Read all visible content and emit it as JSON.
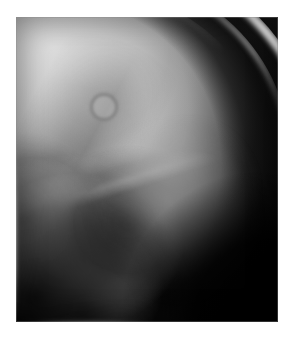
{
  "page": {
    "background_color": "#ffffff",
    "width": 294,
    "height": 337
  },
  "figure": {
    "type": "radiograph",
    "modality": "X-ray",
    "view": "lateral",
    "body_part": "skull",
    "plate": {
      "left": 16,
      "top": 17,
      "width": 262,
      "height": 305,
      "background_color": "#050505",
      "film_base_color": "#6a6a6a",
      "brightest_color": "#fdfdfd",
      "darkest_color": "#050505"
    },
    "regions": [
      {
        "name": "cranial-vault",
        "label": "Cranial vault soft-tissue shadow",
        "tone": "mid-grey",
        "color": "#c4c4c4"
      },
      {
        "name": "outer-table-arc",
        "label": "Bright outer table of skull",
        "tone": "bright",
        "color": "#f5f5f5"
      },
      {
        "name": "inner-table-arc",
        "label": "Inner table / diploe",
        "tone": "light-grey",
        "color": "#cdcdcd"
      },
      {
        "name": "diploe-dark-crescent",
        "label": "Dark crescent of diploic space",
        "tone": "dark",
        "color": "#121212"
      },
      {
        "name": "petrous-mastoid-mass",
        "label": "Dense petrous and mastoid bone",
        "tone": "very-bright",
        "color": "#fdfdfd"
      },
      {
        "name": "mastoid-air-cells",
        "label": "Mottled mastoid air cells",
        "tone": "mottled-dark",
        "color": "#1e1e1e"
      },
      {
        "name": "skull-base-lines",
        "label": "Skull base lamina lines",
        "tone": "bright-line",
        "color": "#dedede"
      },
      {
        "name": "occipital-lamina",
        "label": "Occipital lamina arc",
        "tone": "grey-line",
        "color": "#b2b2b2"
      },
      {
        "name": "background-air",
        "label": "Extracranial air / background",
        "tone": "black",
        "color": "#000000"
      }
    ],
    "lesion": {
      "name": "ring-lesion",
      "label": "Ring-shaped lucent lesion, parietal region",
      "center_x": 101,
      "center_y": 104,
      "diameter": 22,
      "rim_color": "#6c6c6c",
      "center_color": "#c4c4c4"
    }
  }
}
